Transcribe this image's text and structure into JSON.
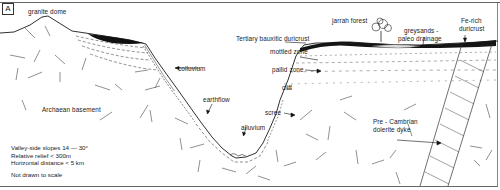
{
  "figure": {
    "panel_label": "A",
    "caption_notes": [
      "Valley-side slopes  14 — 30°",
      "Relative relief  < 300m",
      "Horizontal  distance  < 5 km"
    ],
    "scale_note": "Not drawn to scale"
  },
  "labels": {
    "granite_dome": "granite dome",
    "colluvium": "colluvium",
    "archaean_basement": "Archaean basement",
    "earthflow": "earthflow",
    "alluvium": "alluvium",
    "scree": "scree",
    "cliff": "cliff",
    "pallid_zone": "pallid zone",
    "mottled_zone": "mottled zone",
    "tertiary_duricrust": "Tertiary bauxitic duricrust",
    "jarrah_forest": "jarrah forest",
    "greysands_line1": "greysands -",
    "greysands_line2": "paleo drainage",
    "fe_rich_line1": "Fe-rich",
    "fe_rich_line2": "duricrust",
    "dyke_line1": "Pre - Cambrian",
    "dyke_line2": "dolerite dyke"
  },
  "colors": {
    "ink": "#1a1a1a",
    "frame": "#666666",
    "background": "#ffffff"
  }
}
